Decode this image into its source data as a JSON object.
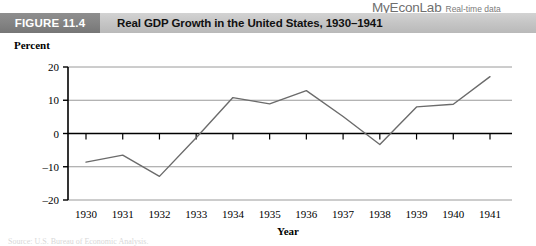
{
  "brand": {
    "name": "MyEconLab",
    "tagline": "Real-time data"
  },
  "header": {
    "figure_tag": "FIGURE 11.4",
    "title": "Real GDP Growth in the United States, 1930–1941"
  },
  "colors": {
    "tag_bg": "#848484",
    "bar_bg": "#c6c6c6",
    "line": "#6b6b6b",
    "gridline": "#9a9a9a",
    "axis": "#000000"
  },
  "caption": {
    "partial_line": "Source: U.S. Bureau of Economic Analysis."
  },
  "chart_data": {
    "type": "line",
    "title": "Real GDP Growth in the United States, 1930–1941",
    "xlabel": "Year",
    "ylabel": "Percent",
    "categories": [
      "1930",
      "1931",
      "1932",
      "1933",
      "1934",
      "1935",
      "1936",
      "1937",
      "1938",
      "1939",
      "1940",
      "1941"
    ],
    "values": [
      -8.6,
      -6.5,
      -12.9,
      -1.3,
      10.8,
      8.9,
      12.9,
      5.1,
      -3.3,
      8.0,
      8.8,
      17.1
    ],
    "ylim": [
      -20,
      20
    ],
    "yticks": [
      20,
      10,
      0,
      -10,
      -20
    ],
    "ytick_labels": [
      "20",
      "10",
      "0",
      "–10",
      "–20"
    ],
    "grid": true,
    "legend": "none",
    "zero_line_emphasis": true
  }
}
